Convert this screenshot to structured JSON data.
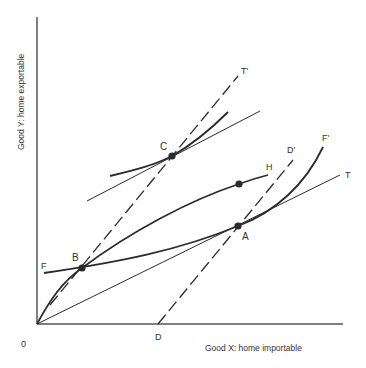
{
  "axes": {
    "y_label": "Good Y: home exportable",
    "x_label": "Good X: home importable",
    "origin_label": "0"
  },
  "points": {
    "A": "A",
    "B": "B",
    "C": "C"
  },
  "line_labels": {
    "F": "F",
    "F_prime": "F'",
    "T": "T",
    "T_prime": "T'",
    "D": "D",
    "D_prime": "D'",
    "H": "H"
  },
  "colors": {
    "ink": "#2b2b2b",
    "axis": "#555555"
  }
}
